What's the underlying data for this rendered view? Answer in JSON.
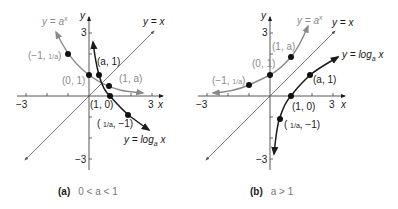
{
  "panels": [
    {
      "id": "a",
      "caption_tag": "(a)",
      "caption_condition": "0 < a < 1",
      "axis_labels": {
        "x": "x",
        "y": "y"
      },
      "tick_labels": {
        "x_min": "−3",
        "x_max": "3",
        "y_max": "3",
        "y_min": "−3"
      },
      "curves": [
        {
          "name": "exponential",
          "label": "y = a",
          "label_sup": "x",
          "color": "#8a8a8a"
        },
        {
          "name": "identity",
          "label": "y = x",
          "color": "#555555"
        },
        {
          "name": "logarithm",
          "label": "y = log",
          "label_sub": "a",
          "label_tail": " x",
          "color": "#1a1a1a"
        }
      ],
      "points": [
        {
          "label": "(−1, 1/a)",
          "x": -1,
          "y": 2
        },
        {
          "label": "(0, 1)",
          "x": 0,
          "y": 1
        },
        {
          "label": "(1, a)",
          "x": 1,
          "y": 0.5
        },
        {
          "label": "(a, 1)",
          "x": 0.5,
          "y": 1
        },
        {
          "label": "(1, 0)",
          "x": 1,
          "y": 0
        },
        {
          "label": "(1/a, −1)",
          "x": 2,
          "y": -1
        }
      ]
    },
    {
      "id": "b",
      "caption_tag": "(b)",
      "caption_condition": "a > 1",
      "axis_labels": {
        "x": "x",
        "y": "y"
      },
      "tick_labels": {
        "x_min": "−3",
        "x_max": "3",
        "y_max": "3",
        "y_min": "−3"
      },
      "curves": [
        {
          "name": "exponential",
          "label": "y = a",
          "label_sup": "x",
          "color": "#8a8a8a"
        },
        {
          "name": "identity",
          "label": "y = x",
          "color": "#555555"
        },
        {
          "name": "logarithm",
          "label": "y = log",
          "label_sub": "a",
          "label_tail": " x",
          "color": "#1a1a1a"
        }
      ],
      "points": [
        {
          "label": "(−1, 1/a)",
          "x": -1,
          "y": 0.5
        },
        {
          "label": "(0, 1)",
          "x": 0,
          "y": 1
        },
        {
          "label": "(1, a)",
          "x": 1,
          "y": 2
        },
        {
          "label": "(a, 1)",
          "x": 2,
          "y": 1
        },
        {
          "label": "(1, 0)",
          "x": 1,
          "y": 0
        },
        {
          "label": "(1/a, −1)",
          "x": 0.5,
          "y": -1
        }
      ]
    }
  ]
}
